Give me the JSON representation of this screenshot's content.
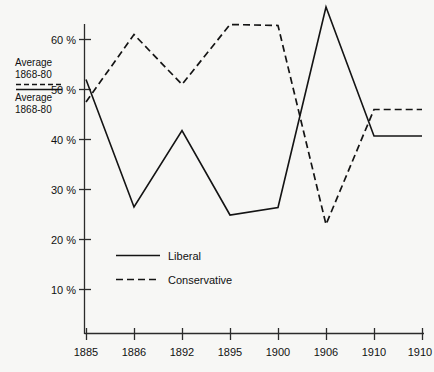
{
  "chart_data": {
    "type": "line",
    "title": "",
    "subtitle": "",
    "xlabel": "",
    "ylabel": "",
    "x": [
      "1885",
      "1886",
      "1892",
      "1895",
      "1900",
      "1906",
      "1910",
      "1910"
    ],
    "categories": [
      "1885",
      "1886",
      "1892",
      "1895",
      "1900",
      "1906",
      "1910",
      "1910"
    ],
    "xtick_labels": [
      "1885",
      "1886",
      "1892",
      "1895",
      "1900",
      "1906",
      "1910",
      "1910"
    ],
    "ytick_labels": [
      "10 %",
      "20 %",
      "30 %",
      "40 %",
      "50 %",
      "60 %"
    ],
    "ytick_values": [
      10,
      20,
      30,
      40,
      50,
      60
    ],
    "ylim": [
      0,
      68
    ],
    "grid": false,
    "legend_position": "inside-lower-left",
    "series": [
      {
        "name": "Liberal",
        "style": "solid",
        "values": [
          52.0,
          26.5,
          41.8,
          24.9,
          26.4,
          66.5,
          40.7,
          40.7
        ]
      },
      {
        "name": "Conservative",
        "style": "dashed",
        "values": [
          47.5,
          61.0,
          51.0,
          63.0,
          62.8,
          23.0,
          46.0,
          46.0
        ]
      }
    ],
    "annotations": [
      {
        "id": "avg-conservative",
        "label_line1": "Average",
        "label_line2": "1868-80",
        "style": "dashed",
        "value": 51.2
      },
      {
        "id": "avg-liberal",
        "label_line1": "Average",
        "label_line2": "1868-80",
        "style": "solid",
        "value": 50.2
      }
    ]
  },
  "legend": {
    "items": [
      {
        "label": "Liberal",
        "style": "solid"
      },
      {
        "label": "Conservative",
        "style": "dashed"
      }
    ]
  },
  "yaxis": {
    "ticks": [
      {
        "label": "60 %"
      },
      {
        "label": "50 %"
      },
      {
        "label": "40 %"
      },
      {
        "label": "30 %"
      },
      {
        "label": "20 %"
      },
      {
        "label": "10 %"
      }
    ]
  },
  "xaxis": {
    "ticks": [
      {
        "label": "1885"
      },
      {
        "label": "1886"
      },
      {
        "label": "1892"
      },
      {
        "label": "1895"
      },
      {
        "label": "1900"
      },
      {
        "label": "1906"
      },
      {
        "label": "1910"
      },
      {
        "label": "1910"
      }
    ]
  },
  "annotations": {
    "upper": {
      "line1": "Average",
      "line2": "1868-80"
    },
    "lower": {
      "line1": "Average",
      "line2": "1868-80"
    }
  },
  "colors": {
    "background": "#f7f7f5",
    "ink": "#141414",
    "axis": "#2b2b2b"
  }
}
